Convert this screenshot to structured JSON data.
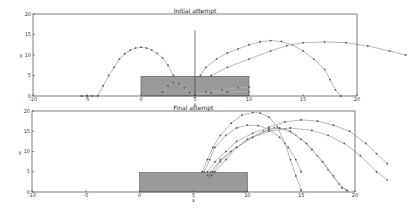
{
  "chart_data": [
    {
      "type": "line",
      "title": "Initial attempt",
      "xlabel": "x",
      "ylabel": "y",
      "xlim": [
        -10,
        20
      ],
      "ylim": [
        0,
        20
      ],
      "xticks": [
        "-10",
        "-5",
        "0",
        "5",
        "10",
        "15",
        "20"
      ],
      "yticks": [
        "0",
        "5",
        "10",
        "15",
        "20"
      ],
      "grid": false,
      "obstacle": {
        "x0": 0,
        "x1": 10,
        "y0": 0,
        "y1": 4.8,
        "color": "#9a9a9a"
      },
      "series": [
        {
          "name": "trajectory-1",
          "points": [
            [
              -5.5,
              0
            ],
            [
              -5,
              0
            ],
            [
              -4.5,
              0
            ],
            [
              -4,
              0
            ],
            [
              -3.5,
              2.5
            ],
            [
              -3,
              5
            ],
            [
              -2.5,
              7
            ],
            [
              -2,
              9
            ],
            [
              -1.5,
              10.3
            ],
            [
              -1,
              11.2
            ],
            [
              -0.5,
              11.7
            ],
            [
              0,
              11.9
            ],
            [
              0.5,
              11.7
            ],
            [
              1,
              11.2
            ],
            [
              1.5,
              10.4
            ],
            [
              2,
              9.3
            ],
            [
              2.5,
              7.5
            ],
            [
              3,
              5
            ]
          ]
        },
        {
          "name": "trajectory-2",
          "points": [
            [
              5.5,
              5
            ],
            [
              6,
              7
            ],
            [
              7,
              9
            ],
            [
              8,
              10.5
            ],
            [
              9,
              11.5
            ],
            [
              10,
              12.5
            ],
            [
              11,
              13.2
            ],
            [
              12,
              13.5
            ],
            [
              13,
              13.3
            ],
            [
              14,
              12.5
            ],
            [
              15,
              11
            ],
            [
              16,
              9
            ],
            [
              17,
              6.5
            ],
            [
              17.5,
              4
            ],
            [
              18,
              1.5
            ],
            [
              18.5,
              0
            ]
          ]
        },
        {
          "name": "trajectory-3",
          "points": [
            [
              6.5,
              5
            ],
            [
              8,
              7
            ],
            [
              10,
              9
            ],
            [
              12,
              11
            ],
            [
              13.5,
              12.3
            ],
            [
              15,
              13
            ],
            [
              17,
              13.2
            ],
            [
              19,
              13
            ],
            [
              21,
              12.2
            ],
            [
              23,
              11
            ],
            [
              24.5,
              10
            ]
          ]
        },
        {
          "name": "trajectory-4",
          "points": [
            [
              2,
              1
            ],
            [
              2.5,
              2.5
            ],
            [
              3,
              3.2
            ],
            [
              3.5,
              3
            ],
            [
              4,
              2
            ],
            [
              4.5,
              0.8
            ],
            [
              5,
              0.3
            ]
          ]
        },
        {
          "name": "trajectory-5",
          "points": [
            [
              5,
              0.3
            ],
            [
              6,
              1
            ],
            [
              7.5,
              1.5
            ],
            [
              9,
              2
            ],
            [
              10,
              2.2
            ]
          ]
        },
        {
          "name": "trajectory-6",
          "points": [
            [
              5,
              0.2
            ],
            [
              6.5,
              0.8
            ],
            [
              8,
              1
            ],
            [
              10,
              1
            ]
          ]
        }
      ],
      "vline_x": 5
    },
    {
      "type": "line",
      "title": "Final attempt",
      "xlabel": "x",
      "ylabel": "y",
      "xlim": [
        -10,
        20
      ],
      "ylim": [
        0,
        20
      ],
      "xticks": [
        "-10",
        "-5",
        "0",
        "5",
        "10",
        "15",
        "20"
      ],
      "yticks": [
        "0",
        "5",
        "10",
        "15",
        "20"
      ],
      "grid": false,
      "obstacle": {
        "x0": 0,
        "x1": 10,
        "y0": 0,
        "y1": 4.8,
        "color": "#9a9a9a"
      },
      "series": [
        {
          "name": "trajectory-1",
          "points": [
            [
              5.8,
              5
            ],
            [
              6.3,
              8
            ],
            [
              6.8,
              11
            ],
            [
              7.5,
              14
            ],
            [
              8.5,
              17
            ],
            [
              9.5,
              19
            ],
            [
              10.5,
              19.6
            ],
            [
              11.2,
              19.5
            ],
            [
              12,
              18.5
            ],
            [
              12.8,
              16
            ],
            [
              13.5,
              12
            ],
            [
              14,
              8
            ],
            [
              14.5,
              4
            ],
            [
              15,
              0.5
            ]
          ]
        },
        {
          "name": "trajectory-2",
          "points": [
            [
              6,
              5
            ],
            [
              6.5,
              8
            ],
            [
              7,
              11
            ],
            [
              8,
              14
            ],
            [
              9,
              15.8
            ],
            [
              10,
              16.5
            ],
            [
              11,
              16.4
            ],
            [
              12,
              15.5
            ],
            [
              13,
              13.5
            ],
            [
              13.8,
              11
            ],
            [
              14.5,
              8
            ],
            [
              15,
              5
            ]
          ]
        },
        {
          "name": "trajectory-3",
          "points": [
            [
              6.3,
              5
            ],
            [
              7,
              7.5
            ],
            [
              8,
              10
            ],
            [
              9,
              12.5
            ],
            [
              10.5,
              14.5
            ],
            [
              12,
              16
            ],
            [
              13.5,
              17.3
            ],
            [
              15,
              17.8
            ],
            [
              16.5,
              17.5
            ],
            [
              18,
              16.5
            ],
            [
              19.5,
              15
            ],
            [
              21,
              12
            ],
            [
              22,
              9.5
            ],
            [
              23,
              7
            ]
          ]
        },
        {
          "name": "trajectory-4",
          "points": [
            [
              6.6,
              5
            ],
            [
              7.5,
              8
            ],
            [
              9,
              11
            ],
            [
              10.5,
              13.5
            ],
            [
              12,
              15
            ],
            [
              14,
              15.8
            ],
            [
              16,
              15.2
            ],
            [
              17.5,
              14
            ],
            [
              19,
              12
            ],
            [
              20.5,
              9
            ],
            [
              22,
              5
            ],
            [
              23,
              3
            ]
          ]
        },
        {
          "name": "trajectory-5",
          "points": [
            [
              6.8,
              5
            ],
            [
              7.5,
              7.5
            ],
            [
              8.5,
              10
            ],
            [
              10,
              13
            ],
            [
              11.5,
              15
            ],
            [
              12.5,
              15.8
            ],
            [
              13.5,
              15.5
            ],
            [
              14.5,
              14
            ],
            [
              15.5,
              12
            ],
            [
              16.5,
              9
            ],
            [
              17.5,
              5.5
            ],
            [
              18.5,
              2
            ],
            [
              19.2,
              0.5
            ]
          ]
        },
        {
          "name": "trajectory-6",
          "points": [
            [
              7,
              5
            ],
            [
              8,
              8
            ],
            [
              9,
              11
            ],
            [
              10.5,
              13.5
            ],
            [
              12,
              15.5
            ],
            [
              13,
              15.8
            ],
            [
              14,
              15
            ],
            [
              15,
              13
            ],
            [
              16,
              10.5
            ],
            [
              17,
              7.5
            ],
            [
              18,
              4
            ],
            [
              18.8,
              1
            ],
            [
              19.3,
              0.3
            ]
          ]
        }
      ],
      "annotation": {
        "x": 6.5,
        "y": 3.5,
        "text": "*/*"
      }
    }
  ]
}
